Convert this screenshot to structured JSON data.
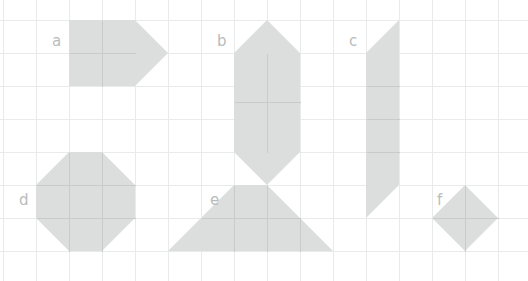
{
  "figure": {
    "canvas": {
      "width": 528,
      "height": 281,
      "background": "#ffffff"
    },
    "grid": {
      "cell_size": 33,
      "line_color": "#e8eaec",
      "x_lines": [
        3,
        36,
        69,
        102,
        135,
        168,
        201,
        234,
        267,
        300,
        333,
        366,
        399,
        432,
        465,
        498
      ],
      "y_lines": [
        20,
        53,
        86,
        119,
        152,
        185,
        218,
        251
      ]
    },
    "style": {
      "fill_color": "#dcdedd",
      "inner_line_color": "#c9cbcb",
      "label_color": "#b9bcbd"
    },
    "shapes": [
      {
        "id": "a",
        "label": "a",
        "name": "shape-a-square-with-point",
        "description": "Two-by-two square block with a triangular point on the right side",
        "label_x": 52,
        "label_y": 46,
        "outline": "69,20 135,20 168,53 135,86 69,86",
        "inner_lines": [
          "102,20 102,86",
          "69,53 135,53"
        ],
        "area_cells": 5
      },
      {
        "id": "b",
        "label": "b",
        "name": "shape-b-hexagon-vertical",
        "description": "Two-by-two square with triangles on top and bottom",
        "label_x": 217,
        "label_y": 46,
        "outline": "234,53 267,20 300,53 300,152 267,185 234,152",
        "inner_lines": [
          "267,53 267,152",
          "234,102 300,102"
        ],
        "area_cells": 6
      },
      {
        "id": "c",
        "label": "c",
        "name": "shape-c-slanted-column",
        "description": "Tall one-wide column of four squares with slanted ends",
        "label_x": 349,
        "label_y": 46,
        "outline": "366,53 399,20 399,185 366,218",
        "inner_lines": [
          "366,86 399,86",
          "366,119 399,119",
          "366,152 399,152"
        ],
        "area_cells": 5
      },
      {
        "id": "d",
        "label": "d",
        "name": "shape-d-octagon",
        "description": "Octagon made from a square grid with the four corners cut off",
        "label_x": 19,
        "label_y": 205,
        "outline": "69,152 102,152 135,185 135,218 102,251 69,251 36,218 36,185",
        "inner_lines": [
          "69,152 69,251",
          "102,152 102,251",
          "36,185 135,185",
          "36,218 135,218"
        ],
        "area_cells": 7
      },
      {
        "id": "e",
        "label": "e",
        "name": "shape-e-trapezoid",
        "description": "Wide isosceles trapezoid resting on the grid line",
        "label_x": 210,
        "label_y": 205,
        "outline": "168,251 234,185 267,185 333,251",
        "inner_lines": [
          "234,185 234,251",
          "267,185 267,251",
          "201,218 300,218",
          "300,218 300,251"
        ],
        "area_cells": 6
      },
      {
        "id": "f",
        "label": "f",
        "name": "shape-f-diamond",
        "description": "Diamond (rotated square) spanning two grid cells",
        "label_x": 437,
        "label_y": 205,
        "outline": "465,185 498,218 465,251 432,218",
        "inner_lines": [
          "465,185 465,251",
          "432,218 498,218"
        ],
        "area_cells": 2
      }
    ]
  }
}
